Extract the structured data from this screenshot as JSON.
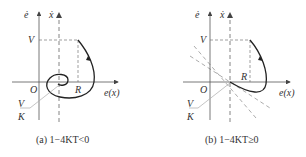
{
  "panels": [
    {
      "id": "a",
      "caption": "(a) 1−4KT<0",
      "labels": {
        "y_axis": "ė",
        "x_dot_axis": "ẋ",
        "x_axis": "e(x)",
        "origin": "O",
        "v_level": "V",
        "r_level": "R",
        "ratio_num": "V",
        "ratio_den": "K"
      },
      "trajectory": "spiral converging to point (V/K, 0)"
    },
    {
      "id": "b",
      "caption": "(b) 1−4KT≥0",
      "labels": {
        "y_axis": "ė",
        "x_dot_axis": "ẋ",
        "x_axis": "e(x)",
        "origin": "O",
        "v_level": "V",
        "r_level": "R",
        "ratio_num": "V",
        "ratio_den": "K"
      },
      "trajectory": "node approach to point (V/K, 0) along asymptotic dashed lines"
    }
  ],
  "colors": {
    "axis": "#555555",
    "curve": "#222222",
    "dashed": "#777777",
    "leader": "#aaaaaa"
  }
}
